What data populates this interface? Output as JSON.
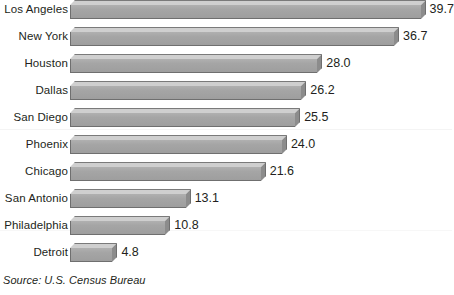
{
  "chart_data": {
    "type": "bar",
    "orientation": "horizontal",
    "title": "",
    "subtitle": "",
    "xlabel": "",
    "ylabel": "",
    "grid": false,
    "legend": null,
    "categories": [
      "Los Angeles",
      "New York",
      "Houston",
      "Dallas",
      "San Diego",
      "Phoenix",
      "Chicago",
      "San Antonio",
      "Philadelphia",
      "Detroit"
    ],
    "values": [
      39.7,
      36.7,
      28.0,
      26.2,
      25.5,
      24.0,
      21.6,
      13.1,
      10.8,
      4.8
    ],
    "value_labels": [
      "39.7",
      "36.7",
      "28.0",
      "26.2",
      "25.5",
      "24.0",
      "21.6",
      "13.1",
      "10.8",
      "4.8"
    ],
    "xlim": [
      0,
      39.7
    ],
    "annotations": [
      "Source: U.S. Census Bureau"
    ]
  },
  "footnote": {
    "source": "Source: U.S. Census Bureau"
  },
  "colors": {
    "bar_face": "#a3a3a3",
    "bar_top": "#cfcfcf",
    "bar_side": "#8c8c8c",
    "bar_outline": "#6f6f6f",
    "text": "#231f20",
    "background": "#ffffff"
  }
}
